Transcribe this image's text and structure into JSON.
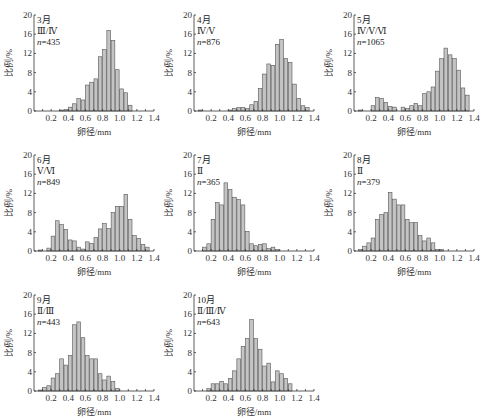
{
  "chart_data": [
    {
      "type": "bar",
      "panel": "3月",
      "stages": "Ⅲ/Ⅳ",
      "n_label": "n",
      "n_value": "=435",
      "xlabel": "卵径/mm",
      "ylabel": "比例/%",
      "ylim": [
        0,
        20
      ],
      "yticks": [
        0,
        4,
        8,
        12,
        16,
        20
      ],
      "xlim": [
        0,
        1.4
      ],
      "xticks": [
        "0.2",
        "0.4",
        "0.6",
        "0.8",
        "1.0",
        "1.2",
        "1.4"
      ],
      "bin_width": 0.05,
      "bin_starts": [
        0.05,
        0.1,
        0.15,
        0.2,
        0.25,
        0.3,
        0.35,
        0.4,
        0.45,
        0.5,
        0.55,
        0.6,
        0.65,
        0.7,
        0.75,
        0.8,
        0.85,
        0.9,
        0.95,
        1.0,
        1.05,
        1.1,
        1.15,
        1.2,
        1.25,
        1.3,
        1.35
      ],
      "values": [
        0,
        0,
        0,
        0,
        0,
        0.2,
        0.3,
        0.8,
        1.5,
        2.6,
        2.3,
        5.4,
        6.0,
        6.7,
        11.3,
        12.8,
        16.8,
        14.7,
        8.6,
        4.6,
        3.8,
        1.2,
        0,
        0,
        0,
        0,
        0
      ]
    },
    {
      "type": "bar",
      "panel": "4月",
      "stages": "Ⅳ/Ⅴ",
      "n_label": "n",
      "n_value": "=876",
      "xlabel": "卵径/mm",
      "ylabel": "比例/%",
      "ylim": [
        0,
        20
      ],
      "yticks": [
        0,
        4,
        8,
        12,
        16,
        20
      ],
      "xlim": [
        0,
        1.4
      ],
      "xticks": [
        "0.2",
        "0.4",
        "0.6",
        "0.8",
        "1.0",
        "1.2",
        "1.4"
      ],
      "bin_width": 0.05,
      "bin_starts": [
        0.05,
        0.1,
        0.15,
        0.2,
        0.25,
        0.3,
        0.35,
        0.4,
        0.45,
        0.5,
        0.55,
        0.6,
        0.65,
        0.7,
        0.75,
        0.8,
        0.85,
        0.9,
        0.95,
        1.0,
        1.05,
        1.1,
        1.15,
        1.2,
        1.25,
        1.3,
        1.35
      ],
      "values": [
        0.2,
        0,
        0,
        0,
        0,
        0,
        0,
        0.2,
        0.5,
        0.7,
        0.7,
        0.5,
        1.3,
        2.0,
        4.7,
        7.7,
        9.8,
        9.5,
        13.9,
        14.9,
        10.9,
        10.1,
        5.6,
        2.6,
        1.1,
        0.7,
        0
      ]
    },
    {
      "type": "bar",
      "panel": "5月",
      "stages": "Ⅳ/Ⅴ/Ⅵ",
      "n_label": "n",
      "n_value": "=1065",
      "xlabel": "卵径/mm",
      "ylabel": "比例/%",
      "ylim": [
        0,
        20
      ],
      "yticks": [
        0,
        4,
        8,
        12,
        16,
        20
      ],
      "xlim": [
        0,
        1.4
      ],
      "xticks": [
        "0.2",
        "0.4",
        "0.6",
        "0.8",
        "1.0",
        "1.2",
        "1.4"
      ],
      "bin_width": 0.05,
      "bin_starts": [
        0.05,
        0.1,
        0.15,
        0.2,
        0.25,
        0.3,
        0.35,
        0.4,
        0.45,
        0.5,
        0.55,
        0.6,
        0.65,
        0.7,
        0.75,
        0.8,
        0.85,
        0.9,
        0.95,
        1.0,
        1.05,
        1.1,
        1.15,
        1.2,
        1.25,
        1.3,
        1.35
      ],
      "values": [
        0.2,
        0,
        0,
        1.1,
        2.8,
        2.6,
        1.8,
        0.9,
        0.8,
        0,
        0.8,
        0.5,
        1.1,
        1.6,
        1.1,
        3.6,
        4.0,
        5.0,
        8.3,
        10.9,
        13.1,
        11.7,
        10.9,
        8.5,
        4.8,
        3.3,
        0
      ]
    },
    {
      "type": "bar",
      "panel": "6月",
      "stages": "Ⅴ/Ⅵ",
      "n_label": "n",
      "n_value": "=849",
      "xlabel": "卵径/mm",
      "ylabel": "比例/%",
      "ylim": [
        0,
        20
      ],
      "yticks": [
        0,
        4,
        8,
        12,
        16,
        20
      ],
      "xlim": [
        0,
        1.4
      ],
      "xticks": [
        "0.2",
        "0.4",
        "0.6",
        "0.8",
        "1.0",
        "1.2",
        "1.4"
      ],
      "bin_width": 0.05,
      "bin_starts": [
        0.05,
        0.1,
        0.15,
        0.2,
        0.25,
        0.3,
        0.35,
        0.4,
        0.45,
        0.5,
        0.55,
        0.6,
        0.65,
        0.7,
        0.75,
        0.8,
        0.85,
        0.9,
        0.95,
        1.0,
        1.05,
        1.1,
        1.15,
        1.2,
        1.25,
        1.3,
        1.35
      ],
      "values": [
        0.2,
        0,
        0.6,
        3.1,
        6.3,
        5.5,
        4.5,
        2.3,
        2.1,
        0.8,
        0.4,
        1.9,
        1.6,
        2.8,
        4.6,
        5.7,
        4.7,
        8.0,
        9.3,
        9.3,
        11.8,
        6.6,
        3.2,
        2.6,
        1.4,
        0.8,
        0
      ]
    },
    {
      "type": "bar",
      "panel": "7月",
      "stages": "Ⅱ",
      "n_label": "n",
      "n_value": "=365",
      "xlabel": "卵径/mm",
      "ylabel": "比例/%",
      "ylim": [
        0,
        20
      ],
      "yticks": [
        0,
        4,
        8,
        12,
        16,
        20
      ],
      "xlim": [
        0,
        1.4
      ],
      "xticks": [
        "0.2",
        "0.4",
        "0.6",
        "0.8",
        "1.0",
        "1.2",
        "1.4"
      ],
      "bin_width": 0.05,
      "bin_starts": [
        0.05,
        0.1,
        0.15,
        0.2,
        0.25,
        0.3,
        0.35,
        0.4,
        0.45,
        0.5,
        0.55,
        0.6,
        0.65,
        0.7,
        0.75,
        0.8,
        0.85,
        0.9,
        0.95,
        1.0,
        1.05,
        1.1,
        1.15,
        1.2,
        1.25,
        1.3,
        1.35
      ],
      "values": [
        0,
        0.8,
        1.5,
        6.6,
        10.1,
        9.6,
        14.2,
        12.8,
        11.2,
        10.7,
        9.6,
        4.1,
        1.5,
        1.1,
        1.4,
        1.5,
        0.5,
        0.8,
        0.3,
        0,
        0,
        0,
        0,
        0,
        0,
        0,
        0
      ]
    },
    {
      "type": "bar",
      "panel": "8月",
      "stages": "Ⅱ",
      "n_label": "n",
      "n_value": "=379",
      "xlabel": "卵径/mm",
      "ylabel": "比例/%",
      "ylim": [
        0,
        20
      ],
      "yticks": [
        0,
        4,
        8,
        12,
        16,
        20
      ],
      "xlim": [
        0,
        1.4
      ],
      "xticks": [
        "0.2",
        "0.4",
        "0.6",
        "0.8",
        "1.0",
        "1.2",
        "1.4"
      ],
      "bin_width": 0.05,
      "bin_starts": [
        0.05,
        0.1,
        0.15,
        0.2,
        0.25,
        0.3,
        0.35,
        0.4,
        0.45,
        0.5,
        0.55,
        0.6,
        0.65,
        0.7,
        0.75,
        0.8,
        0.85,
        0.9,
        0.95,
        1.0,
        1.05,
        1.1,
        1.15,
        1.2,
        1.25,
        1.3,
        1.35
      ],
      "values": [
        0.3,
        1.0,
        1.7,
        2.7,
        6.6,
        7.6,
        8.0,
        12.2,
        10.8,
        9.6,
        9.6,
        6.6,
        5.9,
        5.9,
        3.2,
        2.1,
        2.7,
        1.7,
        0.3,
        0.3,
        0,
        0,
        0,
        0,
        0,
        0,
        0
      ]
    },
    {
      "type": "bar",
      "panel": "9月",
      "stages": "Ⅱ/Ⅲ",
      "n_label": "n",
      "n_value": "=443",
      "xlabel": "卵径/mm",
      "ylabel": "比例/%",
      "ylim": [
        0,
        20
      ],
      "yticks": [
        0,
        4,
        8,
        12,
        16,
        20
      ],
      "xlim": [
        0,
        1.4
      ],
      "xticks": [
        "0.2",
        "0.4",
        "0.6",
        "0.8",
        "1.0",
        "1.2",
        "1.4"
      ],
      "bin_width": 0.05,
      "bin_starts": [
        0.05,
        0.1,
        0.15,
        0.2,
        0.25,
        0.3,
        0.35,
        0.4,
        0.45,
        0.5,
        0.55,
        0.6,
        0.65,
        0.7,
        0.75,
        0.8,
        0.85,
        0.9,
        0.95,
        1.0,
        1.05,
        1.1,
        1.15,
        1.2,
        1.25,
        1.3,
        1.35
      ],
      "values": [
        0.2,
        0.7,
        1.1,
        2.7,
        3.6,
        6.7,
        5.4,
        7.4,
        13.8,
        14.4,
        11.1,
        7.4,
        6.7,
        6.7,
        3.6,
        2.3,
        3.1,
        2.0,
        0.5,
        0,
        0,
        0,
        0,
        0,
        0,
        0,
        0
      ]
    },
    {
      "type": "bar",
      "panel": "10月",
      "stages": "Ⅱ/Ⅲ/Ⅳ",
      "n_label": "n",
      "n_value": "=643",
      "xlabel": "卵径/mm",
      "ylabel": "比例/%",
      "ylim": [
        0,
        20
      ],
      "yticks": [
        0,
        4,
        8,
        12,
        16,
        20
      ],
      "xlim": [
        0,
        1.4
      ],
      "xticks": [
        "0.2",
        "0.4",
        "0.6",
        "0.8",
        "1.0",
        "1.2",
        "1.4"
      ],
      "bin_width": 0.05,
      "bin_starts": [
        0.05,
        0.1,
        0.15,
        0.2,
        0.25,
        0.3,
        0.35,
        0.4,
        0.45,
        0.5,
        0.55,
        0.6,
        0.65,
        0.7,
        0.75,
        0.8,
        0.85,
        0.9,
        0.95,
        1.0,
        1.05,
        1.1,
        1.15,
        1.2,
        1.25,
        1.3,
        1.35
      ],
      "values": [
        0,
        0,
        0.5,
        1.5,
        1.5,
        2.0,
        1.5,
        2.6,
        4.2,
        6.7,
        9.3,
        10.9,
        14.9,
        10.9,
        8.7,
        5.2,
        5.8,
        1.9,
        4.2,
        3.6,
        2.6,
        1.5,
        0,
        0,
        0,
        0,
        0
      ]
    }
  ]
}
